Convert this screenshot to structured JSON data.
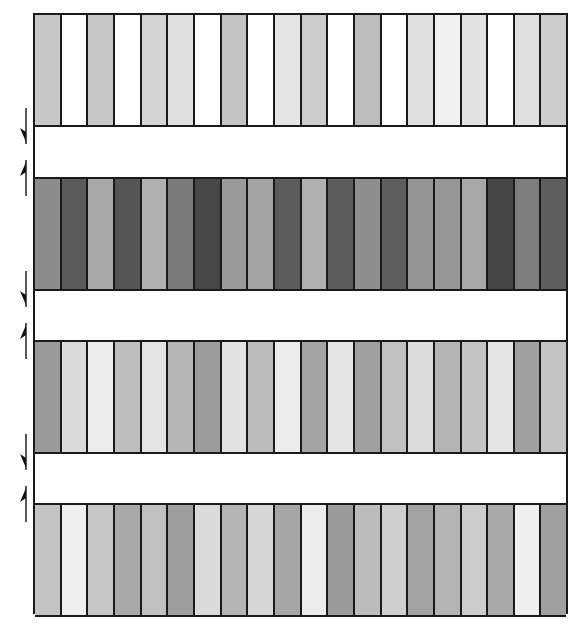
{
  "diagram": {
    "columns_per_strip": 20,
    "border_color": "#1a1a1a",
    "strips": [
      {
        "name": "strip-1",
        "top": 0,
        "height": 112,
        "colors": [
          "#c8c8c8",
          "#ffffff",
          "#c8c8c8",
          "#ffffff",
          "#d4d4d4",
          "#e0e0e0",
          "#ffffff",
          "#c4c4c4",
          "#ffffff",
          "#e4e4e4",
          "#cccccc",
          "#ffffff",
          "#bdbdbd",
          "#ffffff",
          "#dedede",
          "#f0f0f0",
          "#e2e2e2",
          "#ffffff",
          "#e0e0e0",
          "#cdcdcd"
        ]
      },
      {
        "name": "strip-2",
        "top": 164,
        "height": 112,
        "colors": [
          "#8c8c8c",
          "#5a5a5a",
          "#a8a8a8",
          "#555555",
          "#b0b0b0",
          "#7a7a7a",
          "#474747",
          "#9a9a9a",
          "#a4a4a4",
          "#5c5c5c",
          "#b0b0b0",
          "#5c5c5c",
          "#8e8e8e",
          "#5e5e5e",
          "#939393",
          "#969696",
          "#a8a8a8",
          "#464646",
          "#7e7e7e",
          "#5e5e5e"
        ]
      },
      {
        "name": "strip-3",
        "top": 327,
        "height": 112,
        "colors": [
          "#9a9a9a",
          "#dadada",
          "#ececec",
          "#bebebe",
          "#e4e4e4",
          "#b6b6b6",
          "#9c9c9c",
          "#e2e2e2",
          "#bcbcbc",
          "#ececec",
          "#a4a4a4",
          "#e6e6e6",
          "#a0a0a0",
          "#c0c0c0",
          "#dcdcdc",
          "#b4b4b4",
          "#c4c4c4",
          "#e6e6e6",
          "#a0a0a0",
          "#c4c4c4"
        ]
      },
      {
        "name": "strip-4",
        "top": 490,
        "height": 112,
        "colors": [
          "#c4c4c4",
          "#efefef",
          "#c6c6c6",
          "#a8a8a8",
          "#c0c0c0",
          "#9e9e9e",
          "#dadada",
          "#b4b4b4",
          "#d6d6d6",
          "#a6a6a6",
          "#ececec",
          "#9a9a9a",
          "#bcbcbc",
          "#cecece",
          "#a2a2a2",
          "#b4b4b4",
          "#cccccc",
          "#aaaaaa",
          "#efefef",
          "#a0a0a0"
        ]
      }
    ],
    "gaps": [
      {
        "name": "gap-1",
        "top": 112,
        "height": 52
      },
      {
        "name": "gap-2",
        "top": 276,
        "height": 51
      },
      {
        "name": "gap-3",
        "top": 439,
        "height": 51
      }
    ],
    "arrows": [
      {
        "name": "down-arrow-icon",
        "direction": "down",
        "top": 108
      },
      {
        "name": "up-arrow-icon",
        "direction": "up",
        "top": 160
      },
      {
        "name": "down-arrow-icon",
        "direction": "down",
        "top": 271
      },
      {
        "name": "up-arrow-icon",
        "direction": "up",
        "top": 323
      },
      {
        "name": "down-arrow-icon",
        "direction": "down",
        "top": 434
      },
      {
        "name": "up-arrow-icon",
        "direction": "up",
        "top": 486
      }
    ]
  }
}
